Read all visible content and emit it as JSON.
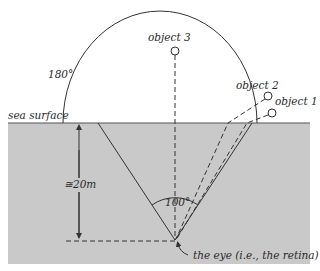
{
  "diagram": {
    "colors": {
      "water": "#c9c9c9",
      "water_edge": "#d2d2d2",
      "line": "#333333",
      "background": "#ffffff"
    },
    "labels": {
      "sea_surface": "sea surface",
      "sky_angle": "180°",
      "object1": "object 1",
      "object2": "object 2",
      "object3": "object 3",
      "depth": "≅20m",
      "cone_angle": "100°",
      "eye": "the eye (i.e., the retina)"
    }
  }
}
